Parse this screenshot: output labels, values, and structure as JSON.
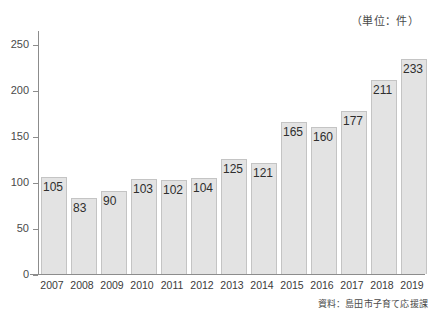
{
  "caption": {
    "unit_note": "（単位：件）",
    "source_note": "資料：島田市子育て応援課"
  },
  "chart_data": {
    "type": "bar",
    "title": "",
    "subtitle": "",
    "xlabel": "",
    "ylabel": "",
    "unit": "件",
    "categories": [
      "2007",
      "2008",
      "2009",
      "2010",
      "2011",
      "2012",
      "2013",
      "2014",
      "2015",
      "2016",
      "2017",
      "2018",
      "2019"
    ],
    "values": [
      105,
      83,
      90,
      103,
      102,
      104,
      125,
      121,
      165,
      160,
      177,
      211,
      233
    ],
    "data_labels": [
      "105",
      "83",
      "90",
      "103",
      "102",
      "104",
      "125",
      "121",
      "165",
      "160",
      "177",
      "211",
      "233"
    ],
    "ylim": [
      0,
      265
    ],
    "yticks": [
      0,
      50,
      100,
      150,
      200,
      250
    ],
    "ytick_labels": [
      "0",
      "50",
      "100",
      "150",
      "200",
      "250"
    ],
    "grid": false,
    "legend": "none",
    "bar_color": "#e3e3e3",
    "bar_border_color": "#c4c4c4",
    "axis_color": "#8c8c8c",
    "label_color": "#2e2e2e",
    "background": "#ffffff"
  }
}
